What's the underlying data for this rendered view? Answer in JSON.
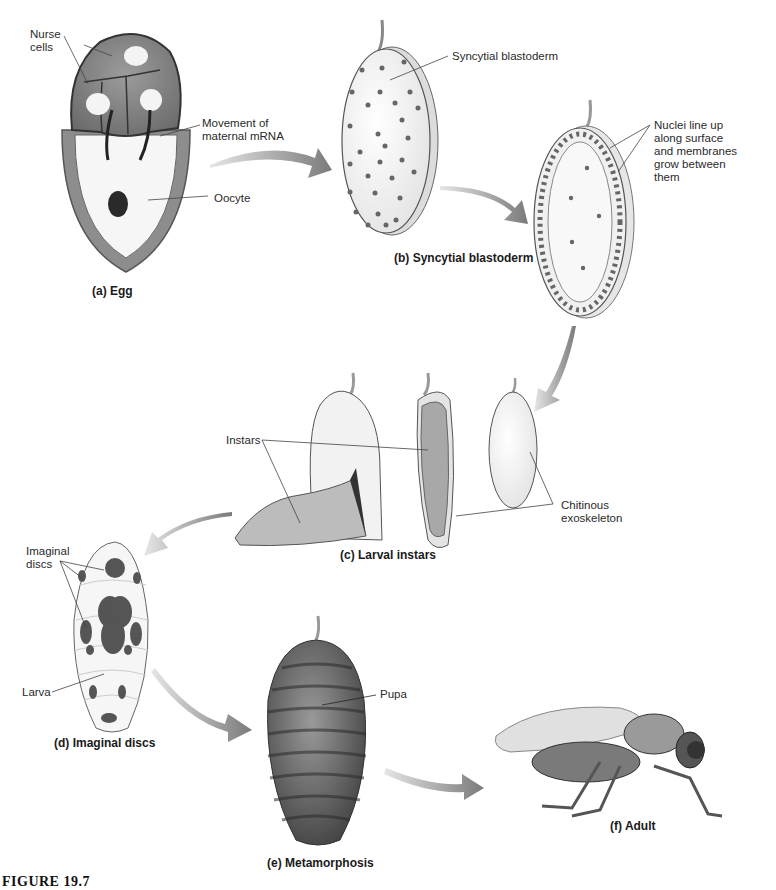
{
  "figure": {
    "caption": "FIGURE 19.7",
    "colors": {
      "background": "#ffffff",
      "ink": "#2a2a2a",
      "arrow": "#8a8a8a",
      "nucleus": "#555555"
    }
  },
  "panels": {
    "a": {
      "caption": "(a) Egg",
      "labels": {
        "nurse_cells": "Nurse\ncells",
        "mrna": "Movement of\nmaternal mRNA",
        "oocyte": "Oocyte"
      }
    },
    "b": {
      "caption": "(b) Syncytial blastoderm",
      "labels": {
        "syncytial": "Syncytial blastoderm",
        "nuclei": "Nuclei line up\nalong surface\nand membranes\ngrow between\nthem"
      }
    },
    "c": {
      "caption": "(c) Larval instars",
      "labels": {
        "instars": "Instars",
        "chitinous": "Chitinous\nexoskeleton"
      }
    },
    "d": {
      "caption": "(d) Imaginal discs",
      "labels": {
        "imaginal": "Imaginal\ndiscs",
        "larva": "Larva"
      }
    },
    "e": {
      "caption": "(e) Metamorphosis",
      "labels": {
        "pupa": "Pupa"
      }
    },
    "f": {
      "caption": "(f) Adult"
    }
  }
}
